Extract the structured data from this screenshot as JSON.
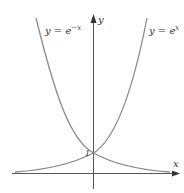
{
  "diagram": {
    "type": "function-graph",
    "axes": {
      "x_label": "x",
      "y_label": "y"
    },
    "curves": [
      {
        "name": "exp-neg",
        "label_base": "y = e",
        "label_exp": "−x"
      },
      {
        "name": "exp-pos",
        "label_base": "y = e",
        "label_exp": "x"
      }
    ],
    "intercept_label": "1",
    "colors": {
      "curve": "#8a8a8a",
      "axis": "#555555",
      "text": "#333333"
    }
  }
}
